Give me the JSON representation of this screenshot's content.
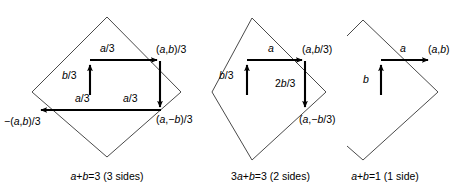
{
  "figure": {
    "panels": [
      {
        "id": "panel-1",
        "caption": "a+b=3 (3 sides)",
        "vector_labels": [
          {
            "name": "a-over-3-top",
            "text": "a/3"
          },
          {
            "name": "b-over-3-left",
            "text": "b/3"
          },
          {
            "name": "a-over-3-lower-left",
            "text": "a/3"
          },
          {
            "name": "a-over-3-lower-right",
            "text": "a/3"
          }
        ],
        "point_labels": [
          {
            "name": "point-ab-over-3",
            "text": "(a,b)/3"
          },
          {
            "name": "point-a-minus-b-over-3",
            "text": "(a,−b)/3"
          },
          {
            "name": "point-neg-ab-over-3",
            "text": "−(a,b)/3"
          }
        ]
      },
      {
        "id": "panel-2",
        "caption": "3a+b=3 (2 sides)",
        "vector_labels": [
          {
            "name": "a-top",
            "text": "a"
          },
          {
            "name": "b-over-3-left",
            "text": "b/3"
          },
          {
            "name": "two-b-over-3-down",
            "text": "2b/3"
          }
        ],
        "point_labels": [
          {
            "name": "point-a-b-over-3",
            "text": "(a,b/3)"
          },
          {
            "name": "point-a-minus-b-over-3",
            "text": "(a,−b/3)"
          }
        ]
      },
      {
        "id": "panel-3",
        "caption": "a+b=1 (1 side)",
        "vector_labels": [
          {
            "name": "a-top",
            "text": "a"
          },
          {
            "name": "b-left",
            "text": "b"
          }
        ],
        "point_labels": [
          {
            "name": "point-a-b",
            "text": "(a,b)"
          }
        ]
      }
    ],
    "colors": {
      "diamond_stroke": "#4a4a4a",
      "vector_stroke": "#000000",
      "background": "#ffffff",
      "text": "#000000"
    }
  }
}
